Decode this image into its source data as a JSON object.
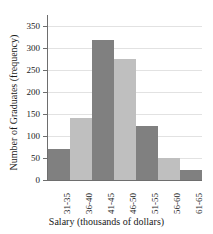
{
  "chart_data": {
    "type": "bar",
    "title": "",
    "xlabel": "Salary (thousands of dollars)",
    "ylabel": "Number of Graduates (frequency)",
    "categories": [
      "31-35",
      "36-40",
      "41-45",
      "46-50",
      "51-55",
      "56-60",
      "61-65"
    ],
    "values": [
      70,
      142,
      318,
      274,
      122,
      50,
      22
    ],
    "ylim": [
      0,
      375
    ],
    "yticks": [
      0,
      50,
      100,
      150,
      200,
      250,
      300,
      350
    ],
    "ytick_labels": [
      "0",
      "50",
      "100",
      "150",
      "200",
      "250",
      "300",
      "350"
    ],
    "grid": true,
    "legend": false,
    "bar_colors": [
      "#808080",
      "#bfbfbf",
      "#808080",
      "#bfbfbf",
      "#808080",
      "#bfbfbf",
      "#808080"
    ],
    "axis_color": "#6e6e6e",
    "grid_color": "#e2e2e2"
  }
}
